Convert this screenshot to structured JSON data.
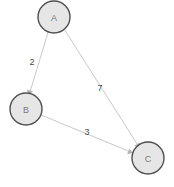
{
  "diagram": {
    "type": "directed-weighted-graph",
    "background_color": "#ffffff",
    "node_fill_color": "#e6e6e6",
    "node_stroke_color": "#4f4f4f",
    "edge_color": "#c9c9c9",
    "label_color": "#4a4a4a",
    "node_label_color": "#7a7a7a",
    "nodes": [
      {
        "id": "A",
        "label": "A",
        "cx": 54,
        "cy": 17,
        "r": 16
      },
      {
        "id": "B",
        "label": "B",
        "cx": 26,
        "cy": 109,
        "r": 16
      },
      {
        "id": "C",
        "label": "C",
        "cx": 148,
        "cy": 158,
        "r": 16
      }
    ],
    "edges": [
      {
        "from": "A",
        "to": "B",
        "weight": "2",
        "label_x": 32,
        "label_y": 63,
        "directed": true
      },
      {
        "from": "A",
        "to": "C",
        "weight": "7",
        "label_x": 100,
        "label_y": 89,
        "directed": true
      },
      {
        "from": "B",
        "to": "C",
        "weight": "3",
        "label_x": 87,
        "label_y": 133,
        "directed": true
      }
    ]
  }
}
